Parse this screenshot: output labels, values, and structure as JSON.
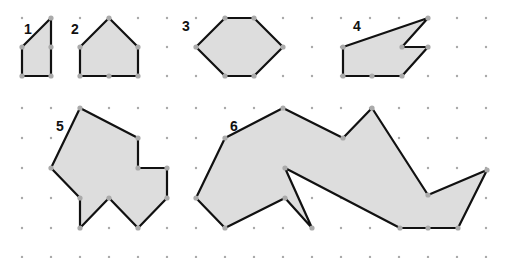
{
  "diagram": {
    "colors": {
      "fill": "#dddddd",
      "stroke": "#111111",
      "dot": "#a8a8a8"
    },
    "grid": {
      "xs": [
        22,
        51,
        80,
        109,
        138,
        167,
        196,
        225,
        254,
        283,
        312,
        341,
        370,
        399,
        428,
        457,
        486
      ],
      "ys_top": [
        18,
        47,
        76
      ],
      "ys_bottom": [
        108,
        138,
        168,
        198,
        228,
        257
      ]
    },
    "shapes": [
      {
        "label": "1",
        "label_pos": [
          24,
          31
        ],
        "points": [
          [
            22,
            47
          ],
          [
            51,
            18
          ],
          [
            51,
            47
          ],
          [
            51,
            76
          ],
          [
            22,
            76
          ]
        ]
      },
      {
        "label": "2",
        "label_pos": [
          71,
          31
        ],
        "points": [
          [
            109,
            18
          ],
          [
            138,
            47
          ],
          [
            138,
            76
          ],
          [
            109,
            76
          ],
          [
            80,
            76
          ],
          [
            80,
            47
          ]
        ]
      },
      {
        "label": "3",
        "label_pos": [
          182,
          28
        ],
        "points": [
          [
            225,
            18
          ],
          [
            254,
            18
          ],
          [
            283,
            47
          ],
          [
            254,
            76
          ],
          [
            225,
            76
          ],
          [
            196,
            47
          ]
        ]
      },
      {
        "label": "4",
        "label_pos": [
          353,
          28
        ],
        "points": [
          [
            343,
            47
          ],
          [
            428,
            18
          ],
          [
            402,
            47
          ],
          [
            428,
            47
          ],
          [
            402,
            76
          ],
          [
            372,
            76
          ],
          [
            343,
            76
          ]
        ]
      },
      {
        "label": "5",
        "label_pos": [
          56,
          128
        ],
        "points": [
          [
            80,
            108
          ],
          [
            138,
            138
          ],
          [
            138,
            168
          ],
          [
            167,
            168
          ],
          [
            167,
            198
          ],
          [
            138,
            228
          ],
          [
            109,
            198
          ],
          [
            80,
            228
          ],
          [
            80,
            198
          ],
          [
            51,
            168
          ]
        ]
      },
      {
        "label": "6",
        "label_pos": [
          230,
          128
        ],
        "points": [
          [
            283,
            108
          ],
          [
            343,
            138
          ],
          [
            372,
            108
          ],
          [
            428,
            195
          ],
          [
            487,
            170
          ],
          [
            458,
            228
          ],
          [
            428,
            228
          ],
          [
            400,
            228
          ],
          [
            285,
            168
          ],
          [
            312,
            228
          ],
          [
            285,
            198
          ],
          [
            225,
            228
          ],
          [
            196,
            198
          ],
          [
            225,
            138
          ]
        ]
      }
    ]
  }
}
